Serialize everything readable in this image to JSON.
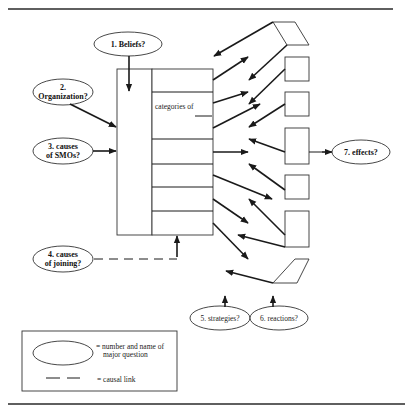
{
  "diagram": {
    "questions": [
      {
        "id": "q1",
        "line1": "1.  Beliefs?",
        "line2": ""
      },
      {
        "id": "q2",
        "line1": "2.",
        "line2": "Organization?"
      },
      {
        "id": "q3",
        "line1": "3.  causes",
        "line2": "of SMOs?"
      },
      {
        "id": "q4",
        "line1": "4. causes",
        "line2": "of joining?"
      },
      {
        "id": "q5",
        "line1": "5.  strategies?",
        "line2": ""
      },
      {
        "id": "q6",
        "line1": "6.  reactions?",
        "line2": ""
      },
      {
        "id": "q7",
        "line1": "7.  effects?",
        "line2": ""
      }
    ],
    "organization_box": {
      "categories_label_line1": "categories of",
      "categories_label_line2": "members",
      "row_count": 7
    },
    "legend": {
      "ellipse_desc_line1": "= number and name of",
      "ellipse_desc_line2": "major question",
      "dash_desc": "= causal link"
    },
    "colors": {
      "stroke": "#1a1a1a",
      "background": "#ffffff"
    }
  }
}
